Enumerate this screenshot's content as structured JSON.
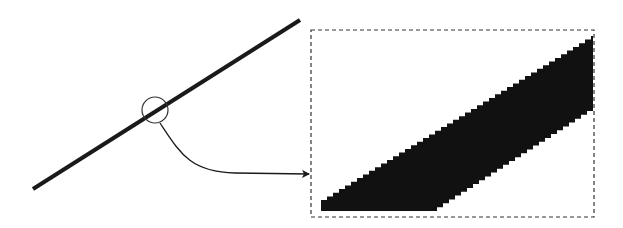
{
  "diagram": {
    "colors": {
      "background": "#ffffff",
      "line": "#1a1a1a",
      "pixels": "#111111",
      "outline": "#333333"
    },
    "line": {
      "x1": 33,
      "y1": 189,
      "x2": 300,
      "y2": 20,
      "stroke_width": 4
    },
    "magnifier_circle": {
      "cx": 155,
      "cy": 110,
      "r": 13
    },
    "connector_arrow": {
      "start": [
        160,
        123
      ],
      "end": [
        309,
        174
      ]
    },
    "zoom_box": {
      "x": 311,
      "y": 30,
      "width": 283,
      "height": 187,
      "dashed": true
    },
    "pixel_staircase": {
      "bottom_left": [
        321,
        211
      ],
      "bottom_right": [
        440,
        211
      ],
      "top_right": [
        593,
        36
      ],
      "right_bottom": [
        593,
        111
      ],
      "left_top": [
        321,
        200
      ],
      "step_w": 6,
      "step_h": 3.5
    }
  }
}
